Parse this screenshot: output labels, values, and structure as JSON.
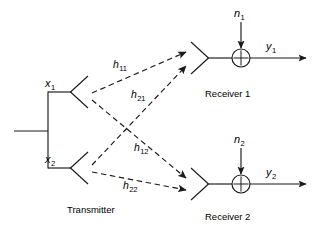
{
  "figure": {
    "type": "block-diagram",
    "stroke_color": "#1a1a1a",
    "background_color": "#ffffff"
  },
  "transmitter": {
    "caption": "Transmitter",
    "antennas": [
      {
        "id": "tx1",
        "signal_label": "x",
        "signal_sub": "1"
      },
      {
        "id": "tx2",
        "signal_label": "x",
        "signal_sub": "2"
      }
    ]
  },
  "channels": [
    {
      "id": "h11",
      "label": "h",
      "sub": "11",
      "from": "tx1",
      "to": "rx1"
    },
    {
      "id": "h21",
      "label": "h",
      "sub": "21",
      "from": "tx2",
      "to": "rx1"
    },
    {
      "id": "h12",
      "label": "h",
      "sub": "12",
      "from": "tx1",
      "to": "rx2"
    },
    {
      "id": "h22",
      "label": "h",
      "sub": "22",
      "from": "tx2",
      "to": "rx2"
    }
  ],
  "receivers": [
    {
      "id": "rx1",
      "caption": "Receiver 1",
      "noise_label": "n",
      "noise_sub": "1",
      "output_label": "y",
      "output_sub": "1",
      "adder_symbol": "+"
    },
    {
      "id": "rx2",
      "caption": "Receiver 2",
      "noise_label": "n",
      "noise_sub": "2",
      "output_label": "y",
      "output_sub": "2",
      "adder_symbol": "+"
    }
  ]
}
